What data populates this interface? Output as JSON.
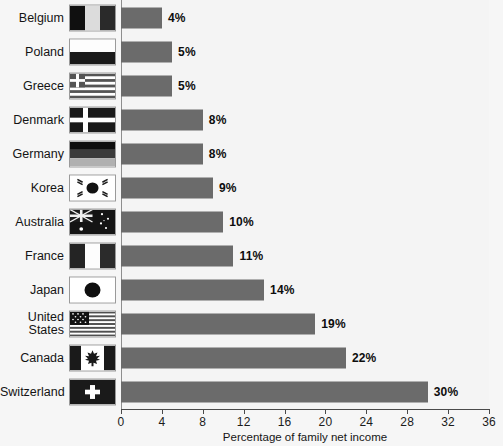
{
  "chart_data": {
    "type": "bar",
    "orientation": "horizontal",
    "title": "",
    "xlabel": "Percentage of family net income",
    "ylabel": "",
    "xlim": [
      0,
      36
    ],
    "xticks": [
      0,
      4,
      8,
      12,
      16,
      20,
      24,
      28,
      32,
      36
    ],
    "xtick_labels": [
      "0",
      "4",
      "8",
      "12",
      "16",
      "20",
      "24",
      "28",
      "32",
      "36"
    ],
    "grid": false,
    "legend": "none",
    "value_suffix": "%",
    "categories": [
      "Belgium",
      "Poland",
      "Greece",
      "Denmark",
      "Germany",
      "Korea",
      "Australia",
      "France",
      "Japan",
      "United\nStates",
      "Canada",
      "Switzerland"
    ],
    "values": [
      4,
      5,
      5,
      8,
      8,
      9,
      10,
      11,
      14,
      19,
      22,
      30
    ],
    "data_labels": [
      "4%",
      "5%",
      "5%",
      "8%",
      "8%",
      "9%",
      "10%",
      "11%",
      "14%",
      "19%",
      "22%",
      "30%"
    ],
    "series": [
      {
        "name": "Percentage of family net income",
        "color": "#6b6b6b",
        "values": [
          4,
          5,
          5,
          8,
          8,
          9,
          10,
          11,
          14,
          19,
          22,
          30
        ]
      }
    ],
    "rows": [
      {
        "country": "Belgium",
        "label": "Belgium",
        "value": 4,
        "data_label": "4%",
        "flag": "flag-belgium"
      },
      {
        "country": "Poland",
        "label": "Poland",
        "value": 5,
        "data_label": "5%",
        "flag": "flag-poland"
      },
      {
        "country": "Greece",
        "label": "Greece",
        "value": 5,
        "data_label": "5%",
        "flag": "flag-greece"
      },
      {
        "country": "Denmark",
        "label": "Denmark",
        "value": 8,
        "data_label": "8%",
        "flag": "flag-denmark"
      },
      {
        "country": "Germany",
        "label": "Germany",
        "value": 8,
        "data_label": "8%",
        "flag": "flag-germany"
      },
      {
        "country": "Korea",
        "label": "Korea",
        "value": 9,
        "data_label": "9%",
        "flag": "flag-korea"
      },
      {
        "country": "Australia",
        "label": "Australia",
        "value": 10,
        "data_label": "10%",
        "flag": "flag-australia"
      },
      {
        "country": "France",
        "label": "France",
        "value": 11,
        "data_label": "11%",
        "flag": "flag-france"
      },
      {
        "country": "Japan",
        "label": "Japan",
        "value": 14,
        "data_label": "14%",
        "flag": "flag-japan"
      },
      {
        "country": "United States",
        "label": "United\nStates",
        "value": 19,
        "data_label": "19%",
        "flag": "flag-united-states"
      },
      {
        "country": "Canada",
        "label": "Canada",
        "value": 22,
        "data_label": "22%",
        "flag": "flag-canada"
      },
      {
        "country": "Switzerland",
        "label": "Switzerland",
        "value": 30,
        "data_label": "30%",
        "flag": "flag-switzerland"
      }
    ],
    "colors": {
      "bar": "#6b6b6b",
      "background": "#f6f6f6",
      "plot_background": "#f4f4f4",
      "axis": "#4a4a4a",
      "text": "#141414"
    }
  }
}
